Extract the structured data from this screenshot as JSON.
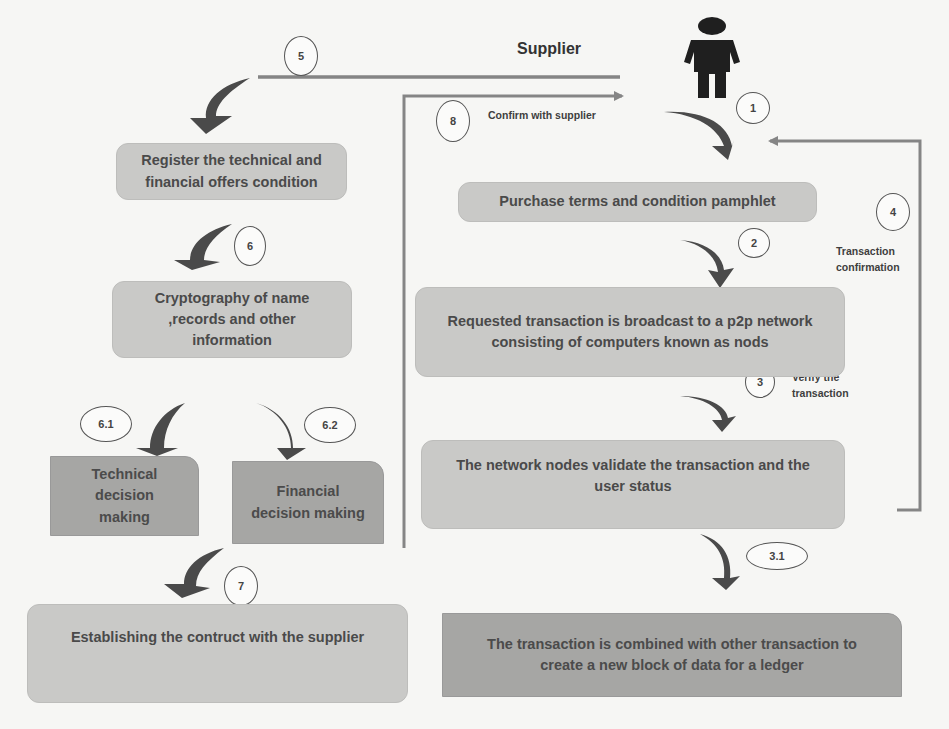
{
  "title": "Supplier",
  "actor": {
    "icon": "person-icon",
    "label": "Supplier"
  },
  "steps": {
    "s1": "1",
    "s2": "2",
    "s3": "3",
    "s3_1": "3.1",
    "s4": "4",
    "s5": "5",
    "s6": "6",
    "s6_1": "6.1",
    "s6_2": "6.2",
    "s7": "7",
    "s8": "8"
  },
  "annotations": {
    "confirm_with_supplier": "Confirm with supplier",
    "transaction_confirmation_1": "Transaction",
    "transaction_confirmation_2": "confirmation",
    "verify_1": "Verify the",
    "verify_2": "transaction"
  },
  "boxes": {
    "register": "Register the technical and financial offers  condition",
    "cryptography": "Cryptography of name ,records and other information",
    "technical": "Technical decision making",
    "financial": "Financial decision making",
    "establishing": "Establishing  the contruct with the supplier",
    "purchase": "Purchase terms and condition pamphlet",
    "broadcast": "Requested transaction is broadcast to a p2p network consisting of computers known as nods",
    "validate": "The network nodes validate the transaction and the user status",
    "combined": "The transaction is combined with other transaction to create a new block of data for a ledger"
  },
  "colors": {
    "box_light": "#c9c9c7",
    "box_dark": "#a6a6a4",
    "arrow": "#4a4a4a",
    "connector": "#7a7a7a"
  }
}
